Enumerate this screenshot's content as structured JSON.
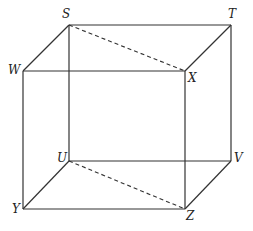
{
  "diagram": {
    "type": "cube",
    "vertices": {
      "S": {
        "label": "S",
        "x": 69,
        "y": 25
      },
      "T": {
        "label": "T",
        "x": 231,
        "y": 25
      },
      "W": {
        "label": "W",
        "x": 23,
        "y": 71
      },
      "X": {
        "label": "X",
        "x": 185,
        "y": 71
      },
      "U": {
        "label": "U",
        "x": 69,
        "y": 161
      },
      "V": {
        "label": "V",
        "x": 231,
        "y": 161
      },
      "Y": {
        "label": "Y",
        "x": 23,
        "y": 209
      },
      "Z": {
        "label": "Z",
        "x": 185,
        "y": 209
      }
    },
    "solid_edges": [
      "ST",
      "SW",
      "TX",
      "WX",
      "SU",
      "TV",
      "WY",
      "XZ",
      "UV",
      "UY",
      "VZ",
      "YZ"
    ],
    "dashed_edges": [
      "SX",
      "UZ"
    ]
  }
}
